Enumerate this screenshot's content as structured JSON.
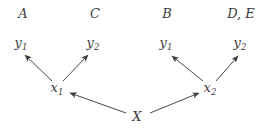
{
  "colors": {
    "ink": "#3d3d3d",
    "edge": "#474747",
    "background": "#ffffff"
  },
  "diagram": {
    "top_labels": [
      "A",
      "C",
      "B",
      "D, E"
    ],
    "leaf_nodes": [
      {
        "base": "y",
        "sub": "1"
      },
      {
        "base": "y",
        "sub": "2"
      },
      {
        "base": "y",
        "sub": "1"
      },
      {
        "base": "y",
        "sub": "2"
      }
    ],
    "mid_nodes": [
      {
        "base": "x",
        "sub": "1"
      },
      {
        "base": "x",
        "sub": "2"
      }
    ],
    "root": "X",
    "edges": [
      {
        "from": "X",
        "to": "x1"
      },
      {
        "from": "X",
        "to": "x2"
      },
      {
        "from": "x1",
        "to": "y1-left"
      },
      {
        "from": "x1",
        "to": "y2-left"
      },
      {
        "from": "x2",
        "to": "y1-right"
      },
      {
        "from": "x2",
        "to": "y2-right"
      }
    ]
  }
}
